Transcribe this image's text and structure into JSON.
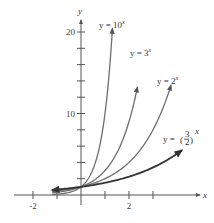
{
  "chart_data": {
    "type": "line",
    "title": "",
    "xlabel": "x",
    "ylabel": "y",
    "xlim": [
      -2.5,
      5.3
    ],
    "ylim": [
      -1,
      21.5
    ],
    "x_ticks": [
      -2,
      -1,
      0,
      1,
      2,
      3
    ],
    "x_tick_labels": [
      "-2",
      "",
      "",
      "",
      "2",
      ""
    ],
    "y_ticks": [
      2,
      4,
      6,
      8,
      10,
      12,
      14,
      16,
      18,
      20
    ],
    "y_tick_labels": [
      "",
      "",
      "",
      "",
      "10",
      "",
      "",
      "",
      "",
      "20"
    ],
    "grid": false,
    "series": [
      {
        "name": "y = 10^x",
        "label_base": "y = 10",
        "label_exp": "x",
        "base": 10,
        "x_range": [
          -1.2,
          1.31
        ],
        "color": "#6e6e6e"
      },
      {
        "name": "y = 3^x",
        "label_base": "y = 3",
        "label_exp": "x",
        "base": 3,
        "x_range": [
          -1.2,
          2.35
        ],
        "color": "#6e6e6e"
      },
      {
        "name": "y = 2^x",
        "label_base": "y = 2",
        "label_exp": "x",
        "base": 2,
        "x_range": [
          -1.2,
          3.75
        ],
        "color": "#6e6e6e"
      },
      {
        "name": "y = (3/2)^x",
        "label_base": "y = ",
        "label_frac_num": "3",
        "label_frac_den": "2",
        "label_exp": "x",
        "base": 1.5,
        "x_range": [
          -1.2,
          4.2
        ],
        "color": "#333333"
      }
    ],
    "arrows": "both ends"
  }
}
